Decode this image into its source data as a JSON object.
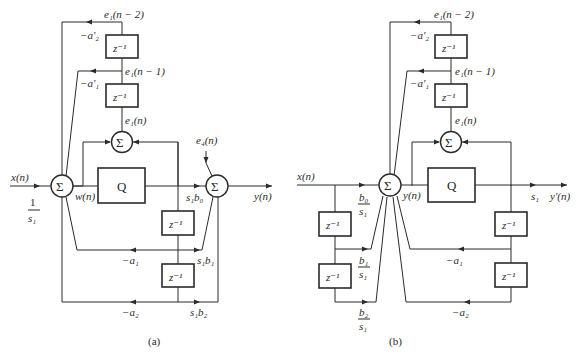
{
  "figure": {
    "panel_a": {
      "caption": "(a)",
      "input_label": "x(n)",
      "input_gain_num": "1",
      "input_gain_den": "s₁",
      "sum_symbol": "Σ",
      "w_label": "w(n)",
      "quantizer_label": "Q",
      "delay_label": "z⁻¹",
      "e1_n2": "e₁(n − 2)",
      "e1_n1": "e₁(n − 1)",
      "e1_n": "e₁(n)",
      "a2p": "−a′₂",
      "a1p": "−a′₁",
      "e4": "e₄(n)",
      "s1b0": "s₁b₀",
      "s1b1": "s₁b₁",
      "s1b2": "s₁b₂",
      "a1": "−a₁",
      "a2": "−a₂",
      "output_label": "y(n)"
    },
    "panel_b": {
      "caption": "(b)",
      "input_label": "x(n)",
      "sum_symbol": "Σ",
      "y_label": "y(n)",
      "quantizer_label": "Q",
      "delay_label": "z⁻¹",
      "e1_n2": "e₁(n − 2)",
      "e1_n1": "e₁(n − 1)",
      "e1_n": "e₁(n)",
      "a2p": "−a′₂",
      "a1p": "−a′₁",
      "b0_num": "b₀",
      "b0_den": "s₁",
      "b1_num": "b₁",
      "b1_den": "s₁",
      "b2_num": "b₂",
      "b2_den": "s₁",
      "a1": "−a₁",
      "a2": "−a₂",
      "s1": "s₁",
      "output_label": "y′(n)"
    }
  }
}
